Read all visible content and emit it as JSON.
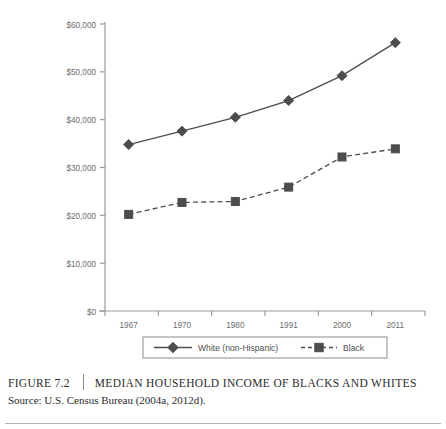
{
  "figure": {
    "number_label": "FIGURE 7.2",
    "title": "MEDIAN HOUSEHOLD INCOME OF BLACKS AND WHITES",
    "source": "Source: U.S. Census Bureau (2004a, 2012d)."
  },
  "colors": {
    "series_white": "#4d4d4d",
    "series_black": "#4d4d4d",
    "axis": "#9a9a9a",
    "text": "#6b6b6b",
    "legend_border": "#8c8c8c",
    "background": "#ffffff"
  },
  "chart_data": {
    "type": "line",
    "title": "Median Household Income of Blacks and Whites",
    "xlabel": "",
    "ylabel": "",
    "categories": [
      "1967",
      "1970",
      "1980",
      "1991",
      "2000",
      "2011"
    ],
    "x": [
      1967,
      1970,
      1980,
      1991,
      2000,
      2011
    ],
    "ylim": [
      0,
      60000
    ],
    "yticks": [
      0,
      10000,
      20000,
      30000,
      40000,
      50000,
      60000
    ],
    "ytick_labels": [
      "$0",
      "$10,000",
      "$20,000",
      "$30,000",
      "$40,000",
      "$50,000",
      "$60,000"
    ],
    "grid": false,
    "legend_position": "bottom",
    "series": [
      {
        "name": "White (non-Hispanic)",
        "marker": "diamond",
        "line_style": "solid",
        "color": "#4d4d4d",
        "values": [
          34800,
          37600,
          40500,
          44000,
          49200,
          56100
        ]
      },
      {
        "name": "Black",
        "marker": "square",
        "line_style": "dashed",
        "color": "#4d4d4d",
        "values": [
          20200,
          22700,
          22900,
          25900,
          32200,
          33900
        ]
      }
    ]
  },
  "legend": {
    "entries": [
      {
        "label": "White (non-Hispanic)"
      },
      {
        "label": "Black"
      }
    ]
  }
}
